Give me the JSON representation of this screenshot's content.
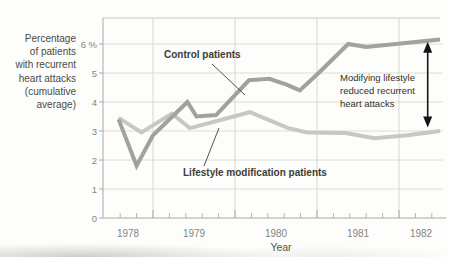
{
  "chart_data": {
    "type": "line",
    "title": "",
    "xlabel": "Year",
    "ylabel": "Percentage\nof patients\nwith recurrent\nheart attacks\n(cumulative\naverage)",
    "x_ticks": [
      1978,
      1979,
      1980,
      1981,
      1982
    ],
    "y_ticks": [
      {
        "value": 0,
        "label": "0"
      },
      {
        "value": 1,
        "label": "1"
      },
      {
        "value": 2,
        "label": "2"
      },
      {
        "value": 3,
        "label": "3"
      },
      {
        "value": 4,
        "label": "4"
      },
      {
        "value": 5,
        "label": "5"
      },
      {
        "value": 6,
        "label": "6 %"
      }
    ],
    "ylim": [
      0,
      6.9
    ],
    "xlim": [
      1978.55,
      1982.55
    ],
    "grid": true,
    "legend_position": "inline-labels",
    "series": [
      {
        "name": "Lifestyle modification patients",
        "slug": "lifestyle",
        "color": "#c6c9bf",
        "points": [
          [
            1978.58,
            3.45
          ],
          [
            1978.86,
            2.95
          ],
          [
            1979.23,
            3.6
          ],
          [
            1979.45,
            3.1
          ],
          [
            1980.18,
            3.65
          ],
          [
            1980.65,
            3.1
          ],
          [
            1980.88,
            2.95
          ],
          [
            1981.35,
            2.93
          ],
          [
            1981.7,
            2.75
          ],
          [
            1982.1,
            2.85
          ],
          [
            1982.5,
            3.0
          ]
        ]
      },
      {
        "name": "Control patients",
        "slug": "control",
        "color": "#a1a19f",
        "points": [
          [
            1978.58,
            3.4
          ],
          [
            1978.8,
            1.8
          ],
          [
            1979.0,
            2.85
          ],
          [
            1979.42,
            4.0
          ],
          [
            1979.53,
            3.5
          ],
          [
            1979.77,
            3.55
          ],
          [
            1980.17,
            4.75
          ],
          [
            1980.42,
            4.8
          ],
          [
            1980.63,
            4.6
          ],
          [
            1980.79,
            4.4
          ],
          [
            1981.02,
            5.0
          ],
          [
            1981.38,
            6.0
          ],
          [
            1981.6,
            5.9
          ],
          [
            1982.5,
            6.15
          ]
        ]
      }
    ],
    "annotation": {
      "text": "Modifying lifestyle\nreduced recurrent\nheart attacks",
      "arrow": {
        "x": 1982.35,
        "from": 6.08,
        "to": 3.12
      }
    },
    "colors": {
      "grid": "#dcdcd7",
      "v_grid": "#d7d7d2",
      "axis": "#a9a9a4",
      "top_border": "#c9c9c4",
      "minor_tick": "#b8b8b3",
      "major_tick": "#a8a8a3",
      "leader": "#3f3f3a",
      "arrow": "#141414",
      "tick_label": "#85857e",
      "text": "#3c3c37"
    }
  }
}
